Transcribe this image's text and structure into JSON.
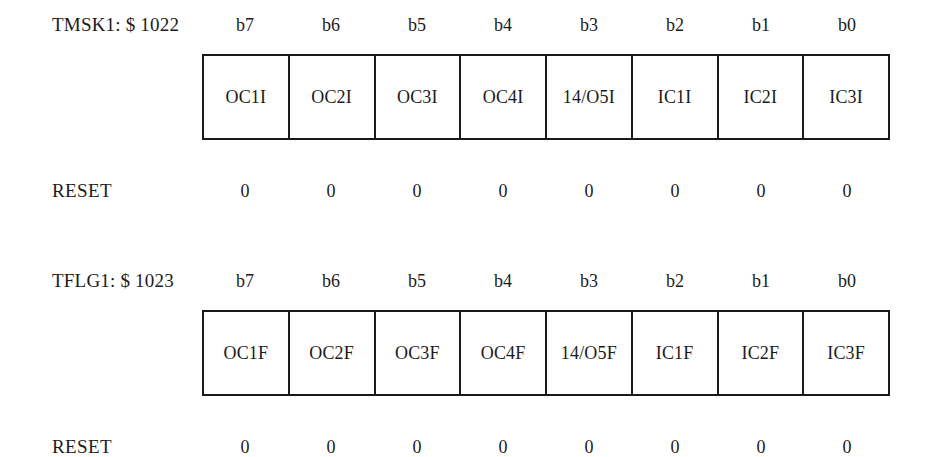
{
  "page": {
    "background_color": "#ffffff",
    "ink_color": "#1b1b1b"
  },
  "registers": [
    {
      "name": "TMSK1: $ 1022",
      "reset_label": "RESET",
      "bit_labels": [
        "b7",
        "b6",
        "b5",
        "b4",
        "b3",
        "b2",
        "b1",
        "b0"
      ],
      "cells": [
        "OC1I",
        "OC2I",
        "OC3I",
        "OC4I",
        "14/O5I",
        "IC1I",
        "IC2I",
        "IC3I"
      ],
      "reset_values": [
        "0",
        "0",
        "0",
        "0",
        "0",
        "0",
        "0",
        "0"
      ]
    },
    {
      "name": "TFLG1: $ 1023",
      "reset_label": "RESET",
      "bit_labels": [
        "b7",
        "b6",
        "b5",
        "b4",
        "b3",
        "b2",
        "b1",
        "b0"
      ],
      "cells": [
        "OC1F",
        "OC2F",
        "OC3F",
        "OC4F",
        "14/O5F",
        "IC1F",
        "IC2F",
        "IC3F"
      ],
      "reset_values": [
        "0",
        "0",
        "0",
        "0",
        "0",
        "0",
        "0",
        "0"
      ]
    }
  ]
}
